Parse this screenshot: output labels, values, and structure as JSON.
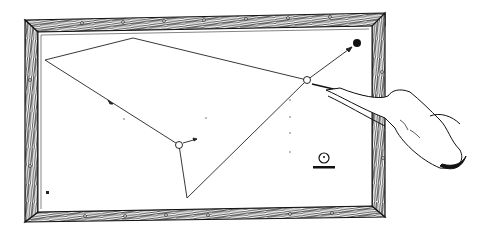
{
  "illustration": {
    "subject": "billiards three-cushion shot diagram",
    "colors": {
      "ink": "#1a1a1a",
      "paper": "#ffffff",
      "rail_wood": "#2a2a2a"
    },
    "table": {
      "outer": [
        25,
        14,
        385,
        222
      ],
      "inner": [
        38,
        27,
        372,
        208
      ]
    },
    "balls": {
      "object_ball_dark": {
        "x": 357,
        "y": 43,
        "r": 4
      },
      "cue_ball": {
        "x": 307,
        "y": 80,
        "r": 3.5
      },
      "second_ball": {
        "x": 179,
        "y": 145,
        "r": 3.5
      },
      "legend_ball": {
        "x": 324,
        "y": 158,
        "r": 5
      }
    },
    "shot_path": [
      [
        307,
        80
      ],
      [
        133,
        38
      ],
      [
        45,
        60
      ],
      [
        179,
        145
      ],
      [
        187,
        198
      ],
      [
        307,
        80
      ]
    ],
    "corner_mark": "H"
  }
}
